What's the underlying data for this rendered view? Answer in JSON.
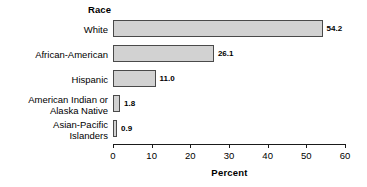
{
  "chart_data": {
    "type": "bar",
    "orientation": "horizontal",
    "title": "",
    "group_title": "Race",
    "categories": [
      "White",
      "African-American",
      "Hispanic",
      "American Indian or\nAlaska Native",
      "Asian-Pacific\nIslanders"
    ],
    "values": [
      54.2,
      26.1,
      11.0,
      1.8,
      0.9
    ],
    "data_labels": [
      "54.2",
      "26.1",
      "11.0",
      "1.8",
      "0.9"
    ],
    "xlabel": "Percent",
    "ylabel": "Race",
    "xlim": [
      0,
      60
    ],
    "xticks": [
      0,
      10,
      20,
      30,
      40,
      50,
      60
    ],
    "xtick_labels": [
      "0",
      "10",
      "20",
      "30",
      "40",
      "50",
      "60"
    ],
    "grid": false,
    "legend": null,
    "colors": {
      "bar_fill": "#d2d2d2",
      "bar_stroke": "#4a4a4a",
      "axis": "#1a1a1a",
      "text": "#000000",
      "background": "#ffffff"
    }
  }
}
